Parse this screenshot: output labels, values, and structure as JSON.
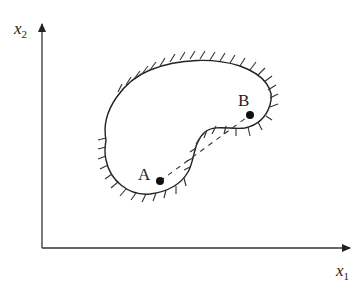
{
  "diagram": {
    "type": "state-space region with obstacle boundary",
    "axes": {
      "x_label": "x",
      "x_subscript": "1",
      "y_label": "x",
      "y_subscript": "2"
    },
    "points": [
      {
        "label": "A",
        "x": 160,
        "y": 181
      },
      {
        "label": "B",
        "x": 250,
        "y": 115
      }
    ],
    "connection": "dashed straight line from A to B crossing the boundary",
    "region": "kidney-shaped region with hatched exterior boundary",
    "colors": {
      "ink": "#222222",
      "background": "#ffffff"
    }
  }
}
